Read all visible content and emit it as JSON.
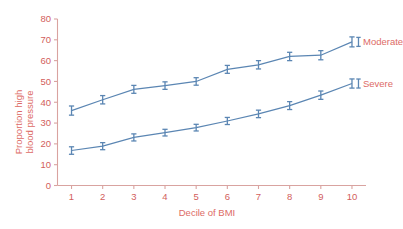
{
  "chart_data": {
    "type": "line",
    "title": "",
    "subtitle": "",
    "xlabel": "Decile of BMI",
    "ylabel": "Proportion high blood pressure",
    "ylabel_line1": "Proportion high",
    "ylabel_line2": "blood pressure",
    "categories": [
      1,
      2,
      3,
      4,
      5,
      6,
      7,
      8,
      9,
      10
    ],
    "x": [
      1,
      2,
      3,
      4,
      5,
      6,
      7,
      8,
      9,
      10
    ],
    "xtick_labels": [
      "1",
      "2",
      "3",
      "4",
      "5",
      "6",
      "7",
      "8",
      "9",
      "10"
    ],
    "ytick_labels": [
      "0",
      "10",
      "20",
      "30",
      "40",
      "50",
      "60",
      "70",
      "80"
    ],
    "yticks": [
      0,
      10,
      20,
      30,
      40,
      50,
      60,
      70,
      80
    ],
    "xlim": [
      0.55,
      10.45
    ],
    "ylim": [
      0,
      80
    ],
    "grid": false,
    "legend_position": "right-inline",
    "error_bars": true,
    "series": [
      {
        "name": "Moderate",
        "values": [
          36,
          41.2,
          46.2,
          48,
          50,
          55.8,
          58,
          62,
          62.6,
          69
        ],
        "errors": [
          2.2,
          2.0,
          1.9,
          1.8,
          1.8,
          1.9,
          2.0,
          2.0,
          2.2,
          2.4
        ],
        "color": "#5b86b3"
      },
      {
        "name": "Severe",
        "values": [
          16.8,
          18.9,
          23.1,
          25.4,
          27.8,
          31,
          34.4,
          38.4,
          43.4,
          49
        ],
        "errors": [
          1.8,
          1.7,
          1.7,
          1.6,
          1.6,
          1.7,
          1.8,
          1.9,
          2.0,
          2.2
        ],
        "color": "#5b86b3"
      }
    ],
    "colors": {
      "line": "#5b86b3",
      "axis": "#d9a3a0",
      "axis_text": "#dd6b66",
      "tick_text": "#d2605c",
      "background": "#ffffff"
    }
  }
}
